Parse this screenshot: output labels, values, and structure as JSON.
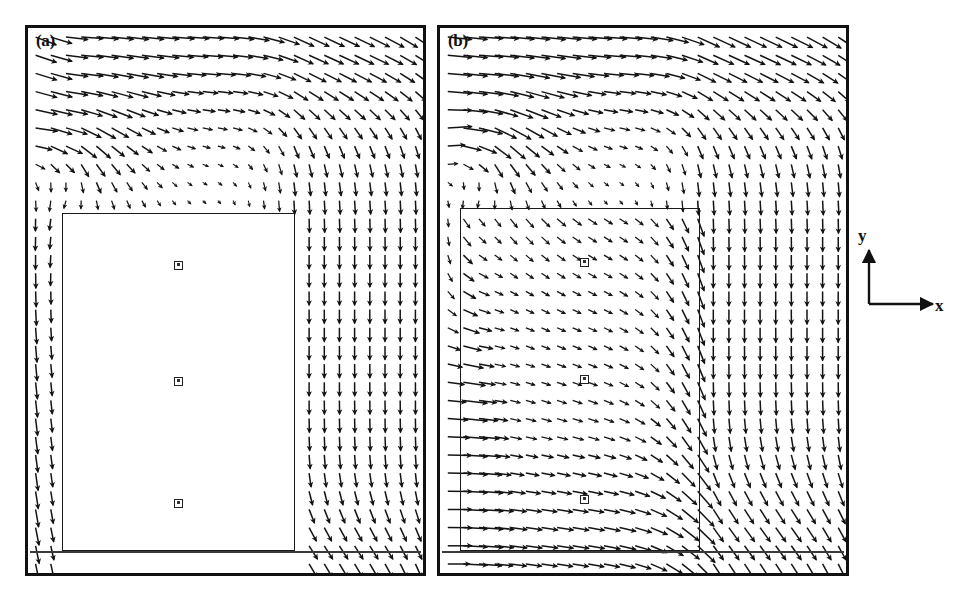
{
  "figure": {
    "panels": [
      {
        "id": "a",
        "label": "(a)",
        "description": "velocity vector field with solid (no-flow) rectangular block region"
      },
      {
        "id": "b",
        "label": "(b)",
        "description": "velocity vector field with porous rectangular region, flow penetrates"
      }
    ],
    "axis_key": {
      "x_label": "x",
      "y_label": "y"
    }
  },
  "chart_data": {
    "type": "scatter",
    "title": "",
    "subtitle": "",
    "xlabel": "x",
    "ylabel": "y",
    "legend_position": "right",
    "grid": false,
    "panels": [
      {
        "label": "(a)",
        "plot_kind": "quiver",
        "domain": {
          "x": [
            0,
            1
          ],
          "y": [
            0,
            1
          ]
        },
        "grid_nx": 26,
        "grid_ny": 30,
        "obstacle": {
          "x0": 0.085,
          "x1": 0.675,
          "y0": 0.0,
          "y1": 0.66,
          "filled": true,
          "vectors_inside": false
        },
        "markers": [
          {
            "x": 0.38,
            "y": 0.565,
            "shape": "square"
          },
          {
            "x": 0.38,
            "y": 0.352,
            "shape": "square"
          },
          {
            "x": 0.38,
            "y": 0.128,
            "shape": "square"
          }
        ],
        "flow_notes": "strong rightward jet along top boundary; downward flow along right gap; strong downward flow in thin left channel"
      },
      {
        "label": "(b)",
        "plot_kind": "quiver",
        "domain": {
          "x": [
            0,
            1
          ],
          "y": [
            0,
            1
          ]
        },
        "grid_nx": 26,
        "grid_ny": 30,
        "obstacle": {
          "x0": 0.05,
          "x1": 0.64,
          "y0": 0.0,
          "y1": 0.67,
          "filled": false,
          "vectors_inside": true
        },
        "markers": [
          {
            "x": 0.355,
            "y": 0.57,
            "shape": "square"
          },
          {
            "x": 0.355,
            "y": 0.355,
            "shape": "square"
          },
          {
            "x": 0.355,
            "y": 0.135,
            "shape": "square"
          }
        ],
        "flow_notes": "strong rightward jet along top; strong rightward inflow along lower-left edge; vectors present throughout porous region"
      }
    ]
  }
}
